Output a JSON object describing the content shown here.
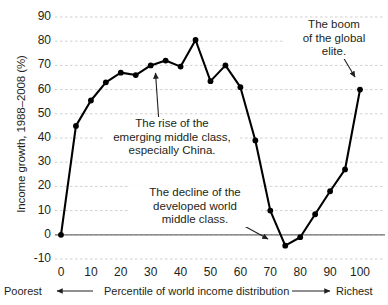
{
  "chart_data": {
    "type": "line",
    "title": "",
    "xlabel": "Percentile of world income distribution",
    "ylabel": "Income growth, 1988–2008 (%)",
    "xlim": [
      -3,
      103
    ],
    "ylim": [
      -13,
      93
    ],
    "grid": true,
    "legend": "none",
    "x": [
      0,
      5,
      10,
      15,
      20,
      25,
      30,
      35,
      40,
      45,
      50,
      55,
      60,
      65,
      70,
      75,
      80,
      85,
      90,
      95,
      100
    ],
    "values": [
      0,
      45,
      55.5,
      63,
      67,
      66,
      70,
      72,
      69.5,
      80.5,
      63.5,
      70,
      61,
      39,
      10,
      -4.5,
      -1,
      8.5,
      18,
      27,
      60
    ],
    "series": [
      {
        "name": "Income growth, 1988–2008 (%)",
        "values": [
          0,
          45,
          55.5,
          63,
          67,
          66,
          70,
          72,
          69.5,
          80.5,
          63.5,
          70,
          61,
          39,
          10,
          -4.5,
          -1,
          8.5,
          18,
          27,
          60
        ]
      }
    ],
    "ytick_labels": [
      "90",
      "80",
      "70",
      "60",
      "50",
      "40",
      "30",
      "20",
      "10",
      "0",
      "-10"
    ],
    "ytick_values": [
      90,
      80,
      70,
      60,
      50,
      40,
      30,
      20,
      10,
      0,
      -10
    ],
    "xtick_labels": [
      "0",
      "10",
      "20",
      "30",
      "40",
      "50",
      "60",
      "70",
      "80",
      "90",
      "100"
    ],
    "xtick_values": [
      0,
      10,
      20,
      30,
      40,
      50,
      60,
      70,
      80,
      90,
      100
    ],
    "annotations": [
      {
        "id": "elite",
        "text": "The boom\nof the global\nelite.",
        "points_to_x": 100,
        "points_to_y": 60
      },
      {
        "id": "rise",
        "text": "The rise of the\nemerging middle class,\nespecially China.",
        "points_to_x": 35,
        "points_to_y": 72
      },
      {
        "id": "decline",
        "text": "The decline of the\ndeveloped world\nmiddle class.",
        "points_to_x": 75,
        "points_to_y": -4.5
      }
    ],
    "zero_line": 0
  },
  "axis": {
    "poorest_label": "Poorest",
    "richest_label": "Richest",
    "x_caption": "Percentile of world income distribution",
    "left_arrow_icon": "left-arrow-icon",
    "right_arrow_icon": "right-arrow-icon"
  },
  "colors": {
    "line": "#000000",
    "marker": "#000000",
    "grid": "#cfcfcf",
    "zero_line": "#6d6e71",
    "text": "#231f20",
    "background": "#ffffff"
  }
}
